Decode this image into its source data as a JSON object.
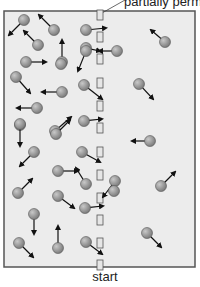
{
  "labels": {
    "top": "partially perm",
    "bottom": "start"
  },
  "colors": {
    "frame": "#555555",
    "background": "#ececec",
    "particle_fill": "#9a9a9a",
    "particle_stroke": "#555555",
    "arrow": "#111111",
    "slot_fill": "#e6e6e6",
    "slot_stroke": "#555555"
  },
  "membrane": {
    "x": 100,
    "slots_y": [
      15,
      37,
      59,
      83,
      106,
      128,
      152,
      175,
      198,
      220,
      243,
      265
    ]
  },
  "particles": [
    {
      "x": 24,
      "y": 20,
      "dx": -15,
      "dy": 15
    },
    {
      "x": 54,
      "y": 30,
      "dx": -15,
      "dy": -15
    },
    {
      "x": 38,
      "y": 45,
      "dx": -14,
      "dy": -14
    },
    {
      "x": 62,
      "y": 62,
      "dx": 0,
      "dy": -22
    },
    {
      "x": 86,
      "y": 30,
      "dx": 20,
      "dy": -2
    },
    {
      "x": 86,
      "y": 48,
      "dx": 14,
      "dy": 3
    },
    {
      "x": 117,
      "y": 51,
      "dx": -18,
      "dy": 0
    },
    {
      "x": 165,
      "y": 42,
      "dx": -14,
      "dy": -12
    },
    {
      "x": 26,
      "y": 62,
      "dx": 20,
      "dy": 0
    },
    {
      "x": 86,
      "y": 51,
      "dx": -8,
      "dy": 20
    },
    {
      "x": 61,
      "y": 64,
      "dx": 0,
      "dy": 0
    },
    {
      "x": 16,
      "y": 77,
      "dx": 14,
      "dy": 16
    },
    {
      "x": 62,
      "y": 92,
      "dx": -20,
      "dy": 0
    },
    {
      "x": 84,
      "y": 85,
      "dx": 18,
      "dy": 14
    },
    {
      "x": 139,
      "y": 84,
      "dx": 14,
      "dy": 15
    },
    {
      "x": 37,
      "y": 108,
      "dx": -20,
      "dy": 0
    },
    {
      "x": 20,
      "y": 125,
      "dx": 0,
      "dy": 0
    },
    {
      "x": 55,
      "y": 131,
      "dx": 16,
      "dy": -14
    },
    {
      "x": 84,
      "y": 121,
      "dx": 18,
      "dy": -2
    },
    {
      "x": 20,
      "y": 127,
      "dx": 0,
      "dy": 0
    },
    {
      "x": 20,
      "y": 125,
      "dx": 0,
      "dy": 0
    },
    {
      "x": 84,
      "y": 122,
      "dx": 0,
      "dy": 0
    },
    {
      "x": 20,
      "y": 126,
      "dx": 0,
      "dy": 0
    },
    {
      "x": 20,
      "y": 124,
      "dx": 0,
      "dy": 22
    },
    {
      "x": 56,
      "y": 134,
      "dx": 14,
      "dy": -14
    },
    {
      "x": 84,
      "y": 121,
      "dx": 0,
      "dy": 0
    },
    {
      "x": 150,
      "y": 141,
      "dx": -18,
      "dy": 0
    },
    {
      "x": 34,
      "y": 152,
      "dx": -14,
      "dy": 14
    },
    {
      "x": 82,
      "y": 152,
      "dx": 18,
      "dy": 10
    },
    {
      "x": 58,
      "y": 171,
      "dx": 20,
      "dy": 0
    },
    {
      "x": 86,
      "y": 184,
      "dx": -10,
      "dy": -16
    },
    {
      "x": 115,
      "y": 181,
      "dx": -12,
      "dy": 16
    },
    {
      "x": 18,
      "y": 193,
      "dx": 14,
      "dy": -14
    },
    {
      "x": 161,
      "y": 186,
      "dx": 14,
      "dy": -14
    },
    {
      "x": 58,
      "y": 196,
      "dx": 16,
      "dy": 12
    },
    {
      "x": 85,
      "y": 208,
      "dx": 18,
      "dy": -2
    },
    {
      "x": 114,
      "y": 191,
      "dx": 0,
      "dy": 0
    },
    {
      "x": 20,
      "y": 194,
      "dx": 0,
      "dy": 0
    },
    {
      "x": 34,
      "y": 214,
      "dx": 0,
      "dy": 20
    },
    {
      "x": 58,
      "y": 248,
      "dx": 0,
      "dy": -22
    },
    {
      "x": 19,
      "y": 243,
      "dx": 14,
      "dy": 14
    },
    {
      "x": 86,
      "y": 242,
      "dx": 16,
      "dy": 12
    },
    {
      "x": 147,
      "y": 233,
      "dx": 14,
      "dy": 14
    }
  ]
}
